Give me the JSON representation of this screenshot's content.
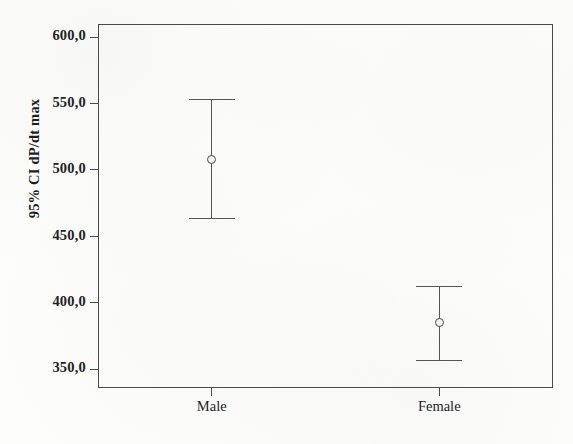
{
  "chart_data": {
    "type": "scatter",
    "title": "",
    "subtitle": "",
    "xlabel": "",
    "ylabel": "95% CI dP/dt max",
    "categories": [
      "Male",
      "Female"
    ],
    "ytick_labels": [
      "600,0",
      "550,0",
      "500,0",
      "450,0",
      "400,0",
      "350,0"
    ],
    "ytick_values": [
      600.0,
      550.0,
      500.0,
      450.0,
      400.0,
      350.0
    ],
    "ylim": [
      336.0,
      610.0
    ],
    "grid": false,
    "legend": null,
    "error_bar_type": "95% confidence interval",
    "points": [
      {
        "category": "Male",
        "mean": 508.0,
        "ci_lower": 463.5,
        "ci_upper": 552.5
      },
      {
        "category": "Female",
        "mean": 385.0,
        "ci_lower": 356.5,
        "ci_upper": 412.0
      }
    ],
    "values": [
      508.0,
      385.0
    ],
    "colors": {
      "axis": "#4a4a4a",
      "errorbar": "#555555",
      "marker_fill": "#f2f2f0",
      "marker_edge": "#4a4a4a",
      "text": "#232323",
      "background": "#fdfdfc"
    }
  }
}
